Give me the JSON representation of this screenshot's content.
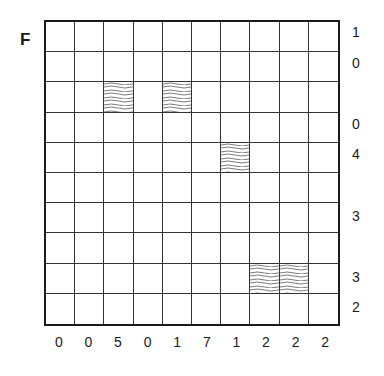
{
  "puzzle": {
    "label": "F",
    "size": 10,
    "row_clues": [
      "1",
      "0",
      "",
      "0",
      "4",
      "",
      "3",
      "",
      "3",
      "2"
    ],
    "col_clues": [
      "0",
      "0",
      "5",
      "0",
      "1",
      "7",
      "1",
      "2",
      "2",
      "2"
    ],
    "water_cells": [
      [
        2,
        2
      ],
      [
        2,
        4
      ],
      [
        4,
        6
      ],
      [
        8,
        7
      ],
      [
        8,
        8
      ]
    ]
  }
}
